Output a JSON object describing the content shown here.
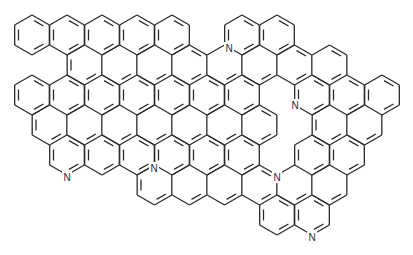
{
  "diagram": {
    "type": "chemical-structure",
    "bond_color": "#2b2b2b",
    "background": "#ffffff",
    "hex": {
      "side": 20,
      "col_step": 35,
      "row_step": 30,
      "x0": 32,
      "y0": 35
    },
    "rings": [
      [
        0,
        0
      ],
      [
        0,
        1
      ],
      [
        0,
        2
      ],
      [
        0,
        3
      ],
      [
        0,
        4
      ],
      [
        0,
        6
      ],
      [
        0,
        7
      ],
      [
        1,
        1
      ],
      [
        1,
        2
      ],
      [
        1,
        3
      ],
      [
        1,
        4
      ],
      [
        1,
        5
      ],
      [
        1,
        6
      ],
      [
        1,
        7
      ],
      [
        1,
        8
      ],
      [
        2,
        0
      ],
      [
        2,
        1
      ],
      [
        2,
        2
      ],
      [
        2,
        3
      ],
      [
        2,
        4
      ],
      [
        2,
        5
      ],
      [
        2,
        6
      ],
      [
        2,
        8
      ],
      [
        2,
        9
      ],
      [
        2,
        10
      ],
      [
        3,
        0
      ],
      [
        3,
        1
      ],
      [
        3,
        2
      ],
      [
        3,
        3
      ],
      [
        3,
        4
      ],
      [
        3,
        5
      ],
      [
        3,
        6
      ],
      [
        3,
        8
      ],
      [
        3,
        9
      ],
      [
        4,
        1
      ],
      [
        4,
        2
      ],
      [
        4,
        3
      ],
      [
        4,
        4
      ],
      [
        4,
        5
      ],
      [
        4,
        6
      ],
      [
        4,
        8
      ],
      [
        4,
        9
      ],
      [
        5,
        3
      ],
      [
        5,
        4
      ],
      [
        5,
        5
      ],
      [
        5,
        6
      ],
      [
        5,
        7
      ],
      [
        5,
        8
      ],
      [
        6,
        7
      ],
      [
        6,
        8
      ]
    ],
    "atoms": [
      {
        "label": "N",
        "x": 229,
        "y": 48
      },
      {
        "label": "N",
        "x": 295,
        "y": 105
      },
      {
        "label": "N",
        "x": 67,
        "y": 177
      },
      {
        "label": "N",
        "x": 154,
        "y": 168
      },
      {
        "label": "N",
        "x": 277,
        "y": 177
      },
      {
        "label": "N",
        "x": 312,
        "y": 237
      }
    ]
  }
}
